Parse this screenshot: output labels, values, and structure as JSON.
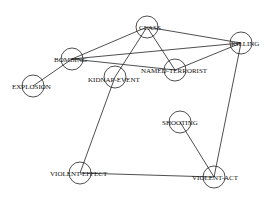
{
  "diagram": {
    "type": "concept-graph",
    "nodes": [
      {
        "id": "CLASS",
        "label": "CLASS",
        "x": 147,
        "y": 27,
        "lx": -8,
        "ly": 2.5
      },
      {
        "id": "KILLING",
        "label": "KILLING",
        "x": 241,
        "y": 43,
        "lx": -10,
        "ly": 2.5
      },
      {
        "id": "BOMBING",
        "label": "BOMBING",
        "x": 72,
        "y": 59,
        "lx": -18,
        "ly": 2.5
      },
      {
        "id": "NAMED-TERRORIST",
        "label": "NAMED-TERRORIST",
        "x": 175,
        "y": 70,
        "lx": -34,
        "ly": 2.5
      },
      {
        "id": "KIDNAP-EVENT",
        "label": "KIDNAP-EVENT",
        "x": 115,
        "y": 77,
        "lx": -27,
        "ly": 4.5
      },
      {
        "id": "EXPLOSION",
        "label": "EXPLOSION",
        "x": 33,
        "y": 86,
        "lx": -21,
        "ly": 2.5
      },
      {
        "id": "SHOOTING",
        "label": "SHOOTING",
        "x": 180,
        "y": 122,
        "lx": -18,
        "ly": 2.5
      },
      {
        "id": "VIOLENT-EFFECT",
        "label": "VIOLENT-EFFECT",
        "x": 80,
        "y": 173,
        "lx": -30,
        "ly": 2.5
      },
      {
        "id": "VIOLENT-ACT",
        "label": "VIOLENT-ACT",
        "x": 214,
        "y": 177,
        "lx": -22,
        "ly": 2.5
      }
    ],
    "edges": [
      {
        "from": "CLASS",
        "to": "BOMBING"
      },
      {
        "from": "CLASS",
        "to": "KILLING"
      },
      {
        "from": "CLASS",
        "to": "NAMED-TERRORIST"
      },
      {
        "from": "CLASS",
        "to": "KIDNAP-EVENT"
      },
      {
        "from": "BOMBING",
        "to": "KILLING"
      },
      {
        "from": "BOMBING",
        "to": "NAMED-TERRORIST"
      },
      {
        "from": "BOMBING",
        "to": "EXPLOSION"
      },
      {
        "from": "KILLING",
        "to": "NAMED-TERRORIST"
      },
      {
        "from": "KILLING",
        "to": "VIOLENT-ACT"
      },
      {
        "from": "KIDNAP-EVENT",
        "to": "VIOLENT-EFFECT"
      },
      {
        "from": "SHOOTING",
        "to": "VIOLENT-ACT"
      },
      {
        "from": "VIOLENT-EFFECT",
        "to": "VIOLENT-ACT"
      }
    ],
    "node_radius": 11
  }
}
